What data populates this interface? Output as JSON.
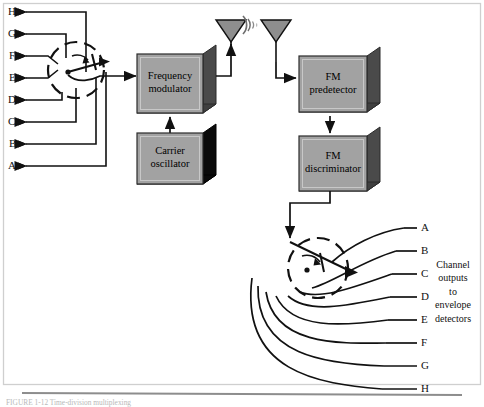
{
  "figure": {
    "caption": "FIGURE 1-12   Time-division multiplexing",
    "frame_color": "#cfcfcf",
    "line_color": "#111111",
    "box_fill": "#a2a2a2",
    "box_edge": "#2b2b2b",
    "shadow_gray": "#4a4a4a",
    "shadow_black": "#0a0a0a",
    "rule_color": "#8d8d8d"
  },
  "inputs": {
    "name": "channel inputs",
    "labels": [
      "H",
      "G",
      "F",
      "E",
      "D",
      "C",
      "B",
      "A"
    ]
  },
  "outputs": {
    "name": "channel outputs",
    "labels": [
      "A",
      "B",
      "C",
      "D",
      "E",
      "F",
      "G",
      "H"
    ],
    "note_lines": [
      "Channel",
      "outputs",
      "to",
      "envelope",
      "detectors"
    ]
  },
  "blocks": [
    {
      "id": "frequency-modulator",
      "line1": "Frequency",
      "line2": "modulator",
      "shadow": "gray"
    },
    {
      "id": "carrier-oscillator",
      "line1": "Carrier",
      "line2": "oscillator",
      "shadow": "black"
    },
    {
      "id": "fm-predetector",
      "line1": "FM",
      "line2": "predetector",
      "shadow": "gray"
    },
    {
      "id": "fm-discriminator",
      "line1": "FM",
      "line2": "discriminator",
      "shadow": "gray"
    }
  ],
  "antennas": {
    "transmit": "transmit-antenna",
    "receive": "receive-antenna",
    "wave": "radio-wave"
  },
  "commutators": {
    "transmit": "transmit-commutator-switch",
    "receive": "receive-commutator-switch"
  }
}
